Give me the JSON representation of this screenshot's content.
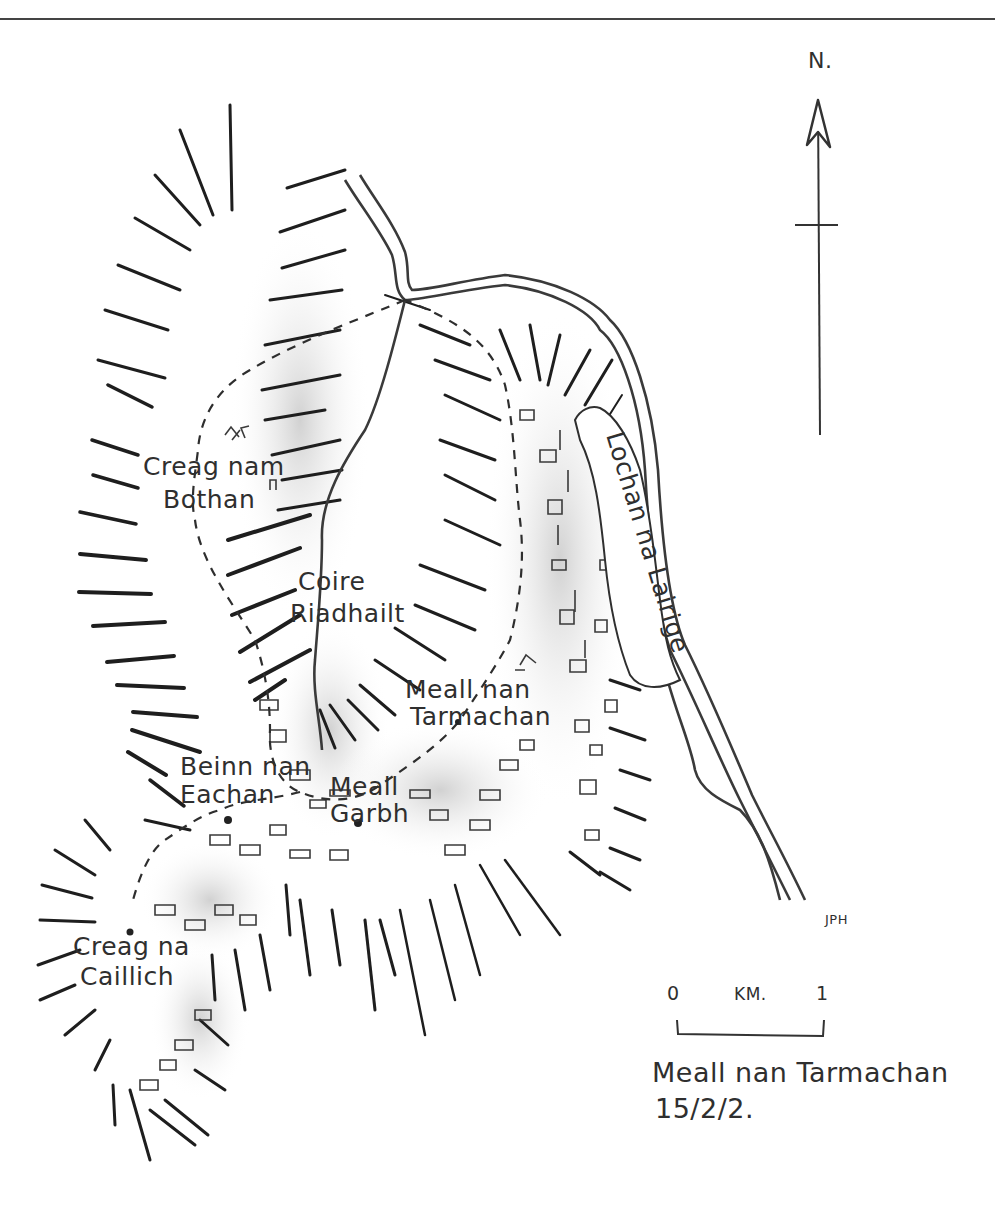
{
  "map": {
    "title": "Meall nan Tarmachan",
    "date": "15/2/2.",
    "author_initials": "JPH",
    "north_label": "N.",
    "scale_bar": {
      "start": "0",
      "unit": "KM.",
      "end": "1"
    },
    "labels": {
      "creag_nam_bothan": [
        "Creag nam",
        "Bothan"
      ],
      "coire_riadhailt": [
        "Coire",
        "Riadhailt"
      ],
      "meall_nan_tarmachan": [
        "Meall nan",
        "Tarmachan"
      ],
      "beinn_nan_eachan": [
        "Beinn nan",
        "Eachan"
      ],
      "meall_garbh": [
        "Meall",
        "Garbh"
      ],
      "creag_na_caillich": [
        "Creag na",
        "Caillich"
      ],
      "lochan_na_lairige": "Lochan na Lairige"
    },
    "colors": {
      "ink": "#2a2a2a",
      "shading": "#d8d8d8",
      "paper": "#ffffff"
    }
  }
}
